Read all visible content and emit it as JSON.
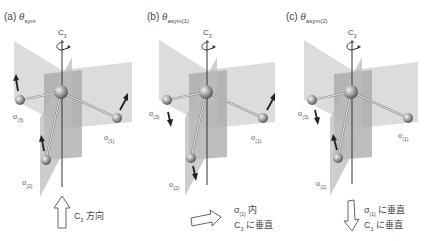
{
  "figure": {
    "axis_label": "C",
    "axis_label_sub": "3",
    "mirror_plane_symbol": "σ",
    "colors": {
      "plane_light": "#d4d4d4",
      "plane_dark": "#9a9a9a",
      "axis": "#333333",
      "atom": "#a8a8a8",
      "bond": "#ffffff",
      "arrow": "#222222"
    }
  },
  "panels": [
    {
      "id": "a",
      "label": "(a)",
      "theta": "θ",
      "theta_sub": "sym",
      "planes": [
        {
          "sym": "σ",
          "sub": "(3)"
        },
        {
          "sym": "σ",
          "sub": "(1)"
        },
        {
          "sym": "σ",
          "sub": "(2)"
        }
      ],
      "displacement_arrows": [
        "up",
        "up",
        "up"
      ],
      "caption_arrow": "up-outline-arrow",
      "caption_lines": [
        {
          "prefix": "C",
          "sub": "3",
          "text": " 方向"
        }
      ]
    },
    {
      "id": "b",
      "label": "(b)",
      "theta": "θ",
      "theta_sub": "asym(1)",
      "planes": [
        {
          "sym": "σ",
          "sub": "(3)"
        },
        {
          "sym": "σ",
          "sub": "(1)"
        },
        {
          "sym": "σ",
          "sub": "(2)"
        }
      ],
      "displacement_arrows": [
        "down",
        "up",
        "down"
      ],
      "caption_arrow": "right-outline-arrow",
      "caption_lines": [
        {
          "prefix": "σ",
          "sub": "(1)",
          "text": " 内"
        },
        {
          "prefix": "C",
          "sub": "3",
          "text": " に垂直"
        }
      ]
    },
    {
      "id": "c",
      "label": "(c)",
      "theta": "θ",
      "theta_sub": "asym(2)",
      "planes": [
        {
          "sym": "σ",
          "sub": "(3)"
        },
        {
          "sym": "σ",
          "sub": "(1)"
        },
        {
          "sym": "σ",
          "sub": "(2)"
        }
      ],
      "displacement_arrows": [
        "down",
        "none",
        "up"
      ],
      "caption_arrow": "down-outline-arrow",
      "caption_lines": [
        {
          "prefix": "σ",
          "sub": "(1)",
          "text": " に垂直"
        },
        {
          "prefix": "C",
          "sub": "3",
          "text": " に垂直"
        }
      ]
    }
  ]
}
